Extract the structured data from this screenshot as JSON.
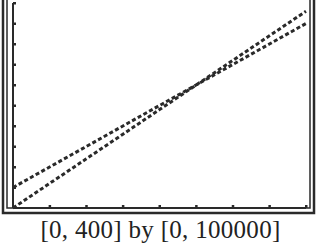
{
  "caption": "[0, 400] by [0, 100000]",
  "colors": {
    "ink": "#2a2a2a",
    "background": "#ffffff"
  },
  "chart_data": {
    "type": "line",
    "title": "",
    "xlabel": "",
    "ylabel": "",
    "xlim": [
      0,
      400
    ],
    "ylim": [
      0,
      100000
    ],
    "xscale": 50,
    "yscale": 10000,
    "grid": false,
    "legend": null,
    "x": [
      0,
      50,
      100,
      150,
      200,
      250,
      300,
      350,
      400
    ],
    "series": [
      {
        "name": "Line 1 (higher intercept, shallower)",
        "values": [
          10000,
          20000,
          30000,
          40000,
          50000,
          60000,
          70000,
          80000,
          90000
        ]
      },
      {
        "name": "Line 2 (through origin, steeper)",
        "values": [
          0,
          12000,
          24000,
          36000,
          48000,
          60000,
          72000,
          84000,
          96000
        ]
      }
    ],
    "annotations": [
      "[0, 400] by [0, 100000]"
    ]
  }
}
